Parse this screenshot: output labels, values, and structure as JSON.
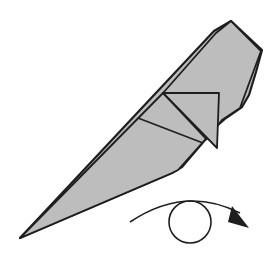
{
  "diagram": {
    "type": "origami-step",
    "colors": {
      "paper_fill": "#bdbdbd",
      "outline": "#1e1e1e",
      "background": "#ffffff"
    },
    "symbol": {
      "name": "turn-over",
      "meaning": "Turn the model over"
    }
  }
}
